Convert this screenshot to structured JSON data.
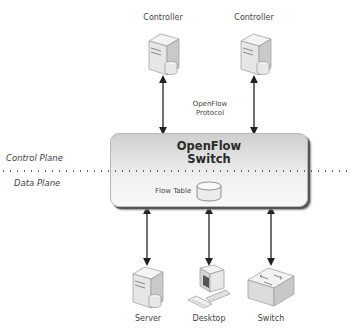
{
  "diagram": {
    "controllers": [
      {
        "label": "Controller",
        "icon": "server-icon"
      },
      {
        "label": "Controller",
        "icon": "server-icon"
      }
    ],
    "protocol_label": {
      "line1": "OpenFlow",
      "line2": "Protocol"
    },
    "switch": {
      "title_line1": "OpenFlow",
      "title_line2": "Switch",
      "flow_table_label": "Flow Table"
    },
    "planes": {
      "control": "Control Plane",
      "data": "Data Plane"
    },
    "devices": [
      {
        "label": "Server",
        "icon": "server-icon"
      },
      {
        "label": "Desktop",
        "icon": "desktop-icon"
      },
      {
        "label": "Switch",
        "icon": "network-switch-icon"
      }
    ],
    "colors": {
      "box_top": "#cfcfcf",
      "box_bottom": "#f8f8f8",
      "arrow": "#222222",
      "text": "#444444"
    }
  }
}
